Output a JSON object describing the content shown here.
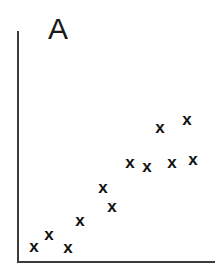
{
  "figure": {
    "width": 223,
    "height": 270,
    "background_color": "#ffffff"
  },
  "panel": {
    "label": "A"
  },
  "axes": {
    "line_color": "#3b3b3b",
    "y_axis_name": "y-axis",
    "x_axis_name": "x-axis",
    "ticks_visible": false,
    "tick_labels_visible": false,
    "grid": false
  },
  "marker": {
    "glyph": "x",
    "color": "#121212",
    "name": "x-marker"
  },
  "chart_data": {
    "type": "scatter",
    "title": "A",
    "xlabel": "",
    "ylabel": "",
    "grid": false,
    "legend": null,
    "axis_ticks": [],
    "marker_symbol": "x",
    "marker_color": "#121212",
    "xlim": [
      0,
      100
    ],
    "ylim": [
      0,
      100
    ],
    "n_points": 12,
    "series": [
      {
        "name": "A",
        "marker": "x",
        "points": [
          {
            "x": 8.6,
            "y": 6.1,
            "px": 34,
            "py": 247
          },
          {
            "x": 16.2,
            "y": 11.3,
            "px": 49,
            "py": 235
          },
          {
            "x": 25.8,
            "y": 5.6,
            "px": 68,
            "py": 248
          },
          {
            "x": 31.8,
            "y": 17.3,
            "px": 80,
            "py": 221
          },
          {
            "x": 43.4,
            "y": 31.6,
            "px": 103,
            "py": 188
          },
          {
            "x": 48.0,
            "y": 23.4,
            "px": 112,
            "py": 207
          },
          {
            "x": 57.1,
            "y": 42.4,
            "px": 130,
            "py": 163
          },
          {
            "x": 65.7,
            "y": 40.7,
            "px": 147,
            "py": 167
          },
          {
            "x": 72.2,
            "y": 57.6,
            "px": 160,
            "py": 128
          },
          {
            "x": 78.3,
            "y": 42.4,
            "px": 172,
            "py": 163
          },
          {
            "x": 85.9,
            "y": 61.0,
            "px": 187,
            "py": 120
          },
          {
            "x": 88.9,
            "y": 43.7,
            "px": 193,
            "py": 160
          }
        ]
      }
    ]
  }
}
